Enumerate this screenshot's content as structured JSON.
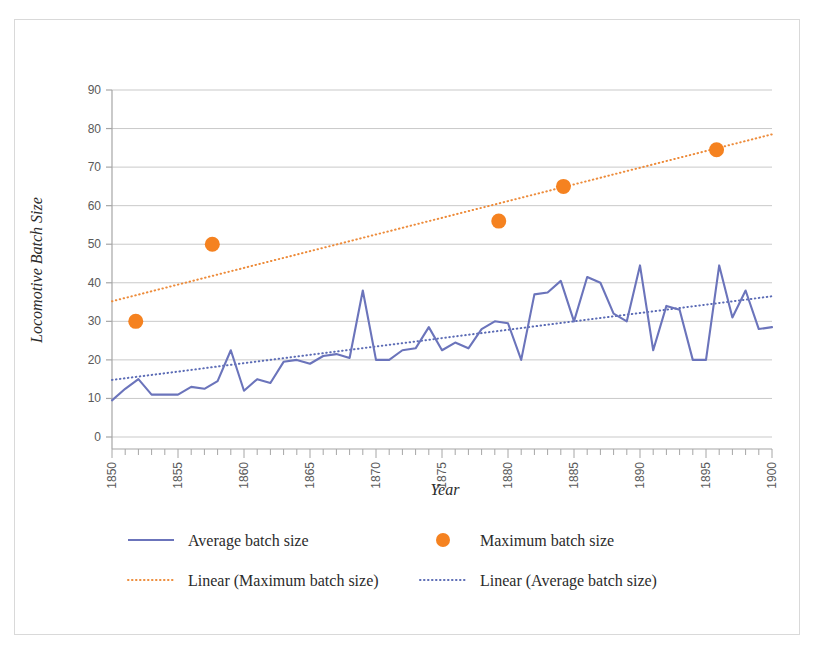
{
  "chart_data": {
    "type": "line",
    "title": "",
    "xlabel": "Year",
    "ylabel": "Locomotive Batch Size",
    "xlim": [
      1850,
      1900
    ],
    "ylim": [
      0,
      90
    ],
    "ytick_step": 10,
    "xtick_major_step": 5,
    "xtick_minor_step": 1,
    "grid": "horizontal",
    "legend_position": "bottom",
    "yticks": [
      "0",
      "10",
      "20",
      "30",
      "40",
      "50",
      "60",
      "70",
      "80",
      "90"
    ],
    "xticks": [
      "1850",
      "1855",
      "1860",
      "1865",
      "1870",
      "1875",
      "1880",
      "1885",
      "1890",
      "1895",
      "1900"
    ],
    "colors": {
      "average_line": "#6b74bb",
      "maximum_marker": "#f58220",
      "maximum_trend": "#ed8b3a",
      "average_trend": "#5b6bb5",
      "gridline": "#c9c9c9",
      "axis": "#a6a6a6",
      "frame_border": "#d9d9d9",
      "text": "#2b2b2b"
    },
    "series": [
      {
        "name": "Average batch size",
        "type": "line",
        "color": "#6b74bb",
        "x": [
          1850,
          1851,
          1852,
          1853,
          1854,
          1855,
          1856,
          1857,
          1858,
          1859,
          1860,
          1861,
          1862,
          1863,
          1864,
          1865,
          1866,
          1867,
          1868,
          1869,
          1870,
          1871,
          1872,
          1873,
          1874,
          1875,
          1876,
          1877,
          1878,
          1879,
          1880,
          1881,
          1882,
          1883,
          1884,
          1885,
          1886,
          1887,
          1888,
          1889,
          1890,
          1891,
          1892,
          1893,
          1894,
          1895,
          1896,
          1897,
          1898,
          1899,
          1900
        ],
        "values": [
          9.5,
          12.5,
          15.0,
          11.0,
          11.0,
          11.0,
          13.0,
          12.5,
          14.5,
          22.5,
          12.0,
          15.0,
          14.0,
          19.5,
          20.0,
          19.0,
          21.0,
          21.5,
          20.5,
          38.0,
          20.0,
          20.0,
          22.5,
          23.0,
          28.5,
          22.5,
          24.5,
          23.0,
          28.0,
          30.0,
          29.5,
          20.0,
          37.0,
          37.5,
          40.5,
          30.0,
          41.5,
          40.0,
          32.0,
          30.0,
          44.5,
          22.5,
          34.0,
          33.0,
          20.0,
          20.0,
          44.5,
          31.0,
          38.0,
          28.0,
          28.5
        ]
      },
      {
        "name": "Maximum batch size",
        "type": "scatter",
        "color": "#f58220",
        "points": [
          {
            "x": 1851.8,
            "y": 30
          },
          {
            "x": 1857.6,
            "y": 50
          },
          {
            "x": 1879.3,
            "y": 56
          },
          {
            "x": 1884.2,
            "y": 65
          },
          {
            "x": 1895.8,
            "y": 74.5
          }
        ]
      },
      {
        "name": "Linear (Maximum batch size)",
        "type": "trendline",
        "style": "dotted",
        "color": "#ed8b3a",
        "endpoints": [
          {
            "x": 1850,
            "y": 35.2
          },
          {
            "x": 1900,
            "y": 78.5
          }
        ]
      },
      {
        "name": "Linear (Average batch size)",
        "type": "trendline",
        "style": "dotted",
        "color": "#5b6bb5",
        "endpoints": [
          {
            "x": 1850,
            "y": 14.8
          },
          {
            "x": 1900,
            "y": 36.5
          }
        ]
      }
    ]
  },
  "legend": {
    "items": [
      {
        "label": "Average batch size",
        "marker": "line-swatch",
        "color": "#6b74bb"
      },
      {
        "label": "Maximum batch size",
        "marker": "dot-swatch",
        "color": "#f58220"
      },
      {
        "label": "Linear (Maximum batch size)",
        "marker": "dotted-swatch",
        "color": "#ed8b3a"
      },
      {
        "label": "Linear (Average batch size)",
        "marker": "dotted-swatch",
        "color": "#5b6bb5"
      }
    ]
  }
}
